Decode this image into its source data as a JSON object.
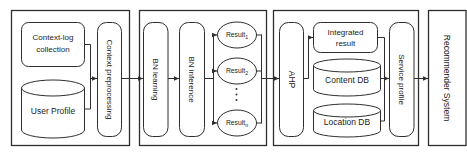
{
  "colors": {
    "stroke": "#2e2e2e",
    "text": "#1c1c1c",
    "background": "#ffffff"
  },
  "stages": {
    "context": {
      "context_log_collection": {
        "line1": "Context-log",
        "line2": "collection"
      },
      "user_profile": "User Profile",
      "context_preprocessing": "Context preprocessing"
    },
    "bn": {
      "bn_learning": "BN learning",
      "bn_inference": "BN inference",
      "results": [
        {
          "label": "Result",
          "sub": "1"
        },
        {
          "label": "Result",
          "sub": "2"
        },
        {
          "label": "Result",
          "sub": "n"
        }
      ]
    },
    "integration": {
      "ahp": "AHP",
      "integrated_result": {
        "line1": "Integrated",
        "line2": "result"
      },
      "content_db": "Content DB",
      "location_db": "Location DB",
      "service_profile": "Service profile"
    },
    "output": {
      "recommender_system": "Recommender System"
    }
  }
}
